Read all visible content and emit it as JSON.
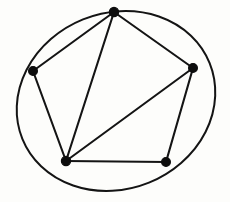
{
  "figure": {
    "kind": "graph-drawing",
    "background_color": "#fdfdfb",
    "ink_color": "#141414",
    "width": 230,
    "height": 202,
    "caption": "",
    "title": ""
  },
  "chart_data": {
    "type": "diagram",
    "title": "",
    "xlabel": "",
    "ylabel": "",
    "vertices": [
      {
        "id": "v-top",
        "label": "",
        "x": 114,
        "y": 12,
        "r": 4.6
      },
      {
        "id": "v-left",
        "label": "",
        "x": 33,
        "y": 71,
        "r": 4.4
      },
      {
        "id": "v-right",
        "label": "",
        "x": 193,
        "y": 68,
        "r": 4.4
      },
      {
        "id": "v-bottom-left",
        "label": "",
        "x": 66,
        "y": 161,
        "r": 4.6
      },
      {
        "id": "v-bottom-right",
        "label": "",
        "x": 166,
        "y": 162,
        "r": 4.4
      }
    ],
    "edges": [
      {
        "id": "e-top-left",
        "from": "v-top",
        "to": "v-left"
      },
      {
        "id": "e-top-right",
        "from": "v-top",
        "to": "v-right"
      },
      {
        "id": "e-top-bottomleft",
        "from": "v-top",
        "to": "v-bottom-left"
      },
      {
        "id": "e-left-bottomleft",
        "from": "v-left",
        "to": "v-bottom-left"
      },
      {
        "id": "e-right-bottomleft",
        "from": "v-right",
        "to": "v-bottom-left"
      },
      {
        "id": "e-right-bottomright",
        "from": "v-right",
        "to": "v-bottom-right"
      },
      {
        "id": "e-bottomleft-bottomright",
        "from": "v-bottom-left",
        "to": "v-bottom-right"
      }
    ],
    "curve": {
      "id": "enclosing-oval",
      "shape": "ellipse",
      "center_x": 116,
      "center_y": 101,
      "radius_x": 101,
      "radius_y": 88,
      "rotation_deg": -22,
      "closed": true
    },
    "counts": {
      "vertices": 5,
      "edges": 7,
      "curves": 1
    }
  }
}
